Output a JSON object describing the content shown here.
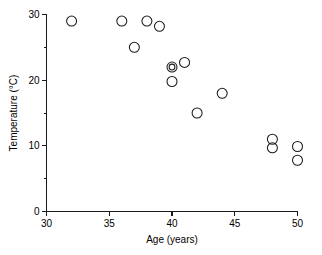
{
  "chart_data": {
    "type": "scatter",
    "title": "",
    "xlabel": "Age (years)",
    "ylabel": "Temperature (°C)",
    "xlim": [
      30,
      50
    ],
    "ylim": [
      0,
      30
    ],
    "grid": false,
    "legend": null,
    "marker": "open-circle",
    "xticks": [
      30,
      35,
      40,
      45,
      50
    ],
    "xtick_labels": [
      "30",
      "35",
      "40",
      "45",
      "50"
    ],
    "yticks": [
      0,
      10,
      20,
      30
    ],
    "ytick_labels": [
      "0",
      "10",
      "20",
      "30"
    ],
    "y_minor_ticks": [
      5,
      15,
      25
    ],
    "x_minor_ticks": [],
    "points": [
      {
        "x": 32.0,
        "y": 29.0
      },
      {
        "x": 36.0,
        "y": 29.0
      },
      {
        "x": 37.0,
        "y": 25.0
      },
      {
        "x": 38.0,
        "y": 29.0
      },
      {
        "x": 39.0,
        "y": 28.2
      },
      {
        "x": 40.0,
        "y": 22.0
      },
      {
        "x": 40.0,
        "y": 22.0
      },
      {
        "x": 40.0,
        "y": 19.8
      },
      {
        "x": 41.0,
        "y": 22.7
      },
      {
        "x": 42.0,
        "y": 15.0
      },
      {
        "x": 44.0,
        "y": 18.0
      },
      {
        "x": 48.0,
        "y": 11.0
      },
      {
        "x": 48.0,
        "y": 9.7
      },
      {
        "x": 50.0,
        "y": 9.9
      },
      {
        "x": 50.0,
        "y": 7.8
      }
    ],
    "overlapping_note": "Point at (40, 22) is drawn as concentric circles indicating two coincident observations",
    "colors": {
      "axis": "#1a1a1a",
      "marker_stroke": "#1a1a1a",
      "background": "#ffffff"
    }
  }
}
